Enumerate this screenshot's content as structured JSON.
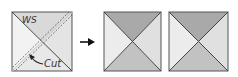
{
  "diagram": {
    "type": "quilt-block-instructions",
    "step_before": {
      "label_ws": "WS",
      "label_cut": "Cut",
      "colors": {
        "top": "#d9d9d9",
        "left": "#f2f2f2",
        "right": "#e4e4e4",
        "bottom": "#e8e8e8",
        "stroke": "#444444"
      }
    },
    "arrow": {
      "symbol": "→",
      "color": "#111111"
    },
    "results": [
      {
        "name": "hourglass-unit-1",
        "colors": {
          "top": "#a9a9a9",
          "bottom": "#c2c2c2",
          "left": "#ececec",
          "right": "#e0e0e0",
          "stroke": "#444444"
        }
      },
      {
        "name": "hourglass-unit-2",
        "colors": {
          "top": "#a9a9a9",
          "bottom": "#c2c2c2",
          "left": "#ececec",
          "right": "#e0e0e0",
          "stroke": "#444444"
        }
      }
    ]
  }
}
